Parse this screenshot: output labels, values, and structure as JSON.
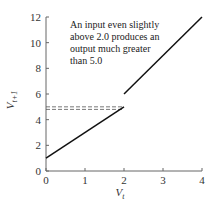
{
  "chart_data": {
    "type": "line",
    "title": "",
    "xlabel": "V_t",
    "ylabel": "V_{t+1}",
    "xlim": [
      0,
      4
    ],
    "ylim": [
      0,
      12
    ],
    "grid": false,
    "x_ticks": [
      "0",
      "1",
      "2",
      "3",
      "4"
    ],
    "y_ticks": [
      "0",
      "2",
      "4",
      "6",
      "8",
      "10",
      "12"
    ],
    "series": [
      {
        "name": "segment-1",
        "x": [
          0,
          2
        ],
        "y": [
          1,
          5
        ],
        "style": "solid"
      },
      {
        "name": "segment-2",
        "x": [
          2,
          4
        ],
        "y": [
          6,
          12
        ],
        "style": "solid"
      }
    ],
    "reference_lines": [
      {
        "name": "dashed-5.0",
        "x": [
          0,
          2
        ],
        "y": [
          5.0,
          5.0
        ],
        "style": "dashed"
      },
      {
        "name": "dashed-4.8",
        "x": [
          0,
          2
        ],
        "y": [
          4.8,
          4.8
        ],
        "style": "dashed"
      }
    ],
    "annotations": [
      "An input even slightly",
      "above 2.0 produces an",
      "output much greater",
      "than 5.0"
    ]
  },
  "labels": {
    "x_main": "V",
    "x_sub": "t",
    "y_main": "V",
    "y_sub": "t+1"
  }
}
